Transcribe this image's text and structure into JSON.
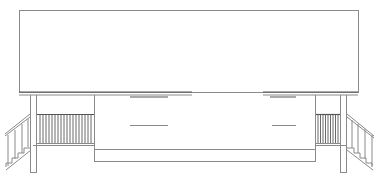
{
  "drawing": {
    "type": "building-elevation",
    "description": "Front elevation line drawing of a raised house with symmetric side porches and stairs",
    "colors": {
      "line": "#8a8a8a",
      "dark_line": "#555555",
      "background": "#ffffff"
    },
    "components": {
      "roof": {
        "label": "roof"
      },
      "left_porch": {
        "label": "left porch",
        "balusters": 18
      },
      "right_porch": {
        "label": "right porch",
        "balusters": 9
      },
      "left_stair": {
        "label": "left stair",
        "steps": 4
      },
      "right_stair": {
        "label": "right stair",
        "steps": 4
      },
      "main_wall": {
        "label": "main wall"
      }
    }
  }
}
